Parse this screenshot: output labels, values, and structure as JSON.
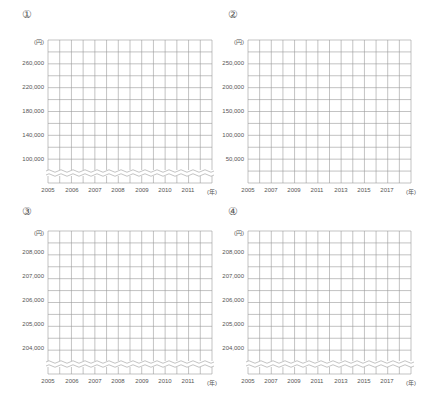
{
  "chart_data": [
    {
      "type": "line",
      "panel_label": "①",
      "y_unit": "(円)",
      "x_unit": "(年)",
      "yticks": [
        "260,000",
        "220,000",
        "180,000",
        "140,000",
        "100,000"
      ],
      "xticks": [
        "2005",
        "2006",
        "2007",
        "2008",
        "2009",
        "2010",
        "2011"
      ],
      "ylim": [
        60000,
        280000
      ],
      "axis_break": true,
      "grid": true,
      "series": []
    },
    {
      "type": "line",
      "panel_label": "②",
      "y_unit": "(円)",
      "x_unit": "(年)",
      "yticks": [
        "250,000",
        "200,000",
        "150,000",
        "100,000",
        "50,000"
      ],
      "xticks": [
        "2005",
        "2007",
        "2009",
        "2011",
        "2013",
        "2015",
        "2017"
      ],
      "ylim": [
        0,
        300000
      ],
      "axis_break": false,
      "grid": true,
      "series": []
    },
    {
      "type": "line",
      "panel_label": "③",
      "y_unit": "(円)",
      "x_unit": "(年)",
      "yticks": [
        "208,000",
        "207,000",
        "206,000",
        "205,000",
        "204,000"
      ],
      "xticks": [
        "2005",
        "2006",
        "2007",
        "2008",
        "2009",
        "2010",
        "2011"
      ],
      "ylim": [
        203000,
        208500
      ],
      "axis_break": true,
      "grid": true,
      "series": []
    },
    {
      "type": "line",
      "panel_label": "④",
      "y_unit": "(円)",
      "x_unit": "(年)",
      "yticks": [
        "208,000",
        "207,000",
        "206,000",
        "205,000",
        "204,000"
      ],
      "xticks": [
        "2005",
        "2007",
        "2009",
        "2011",
        "2013",
        "2015",
        "2017"
      ],
      "ylim": [
        203000,
        208500
      ],
      "axis_break": true,
      "grid": true,
      "series": []
    }
  ],
  "colors": {
    "grid": "#9a9a9a",
    "text": "#555555",
    "background": "#ffffff"
  }
}
